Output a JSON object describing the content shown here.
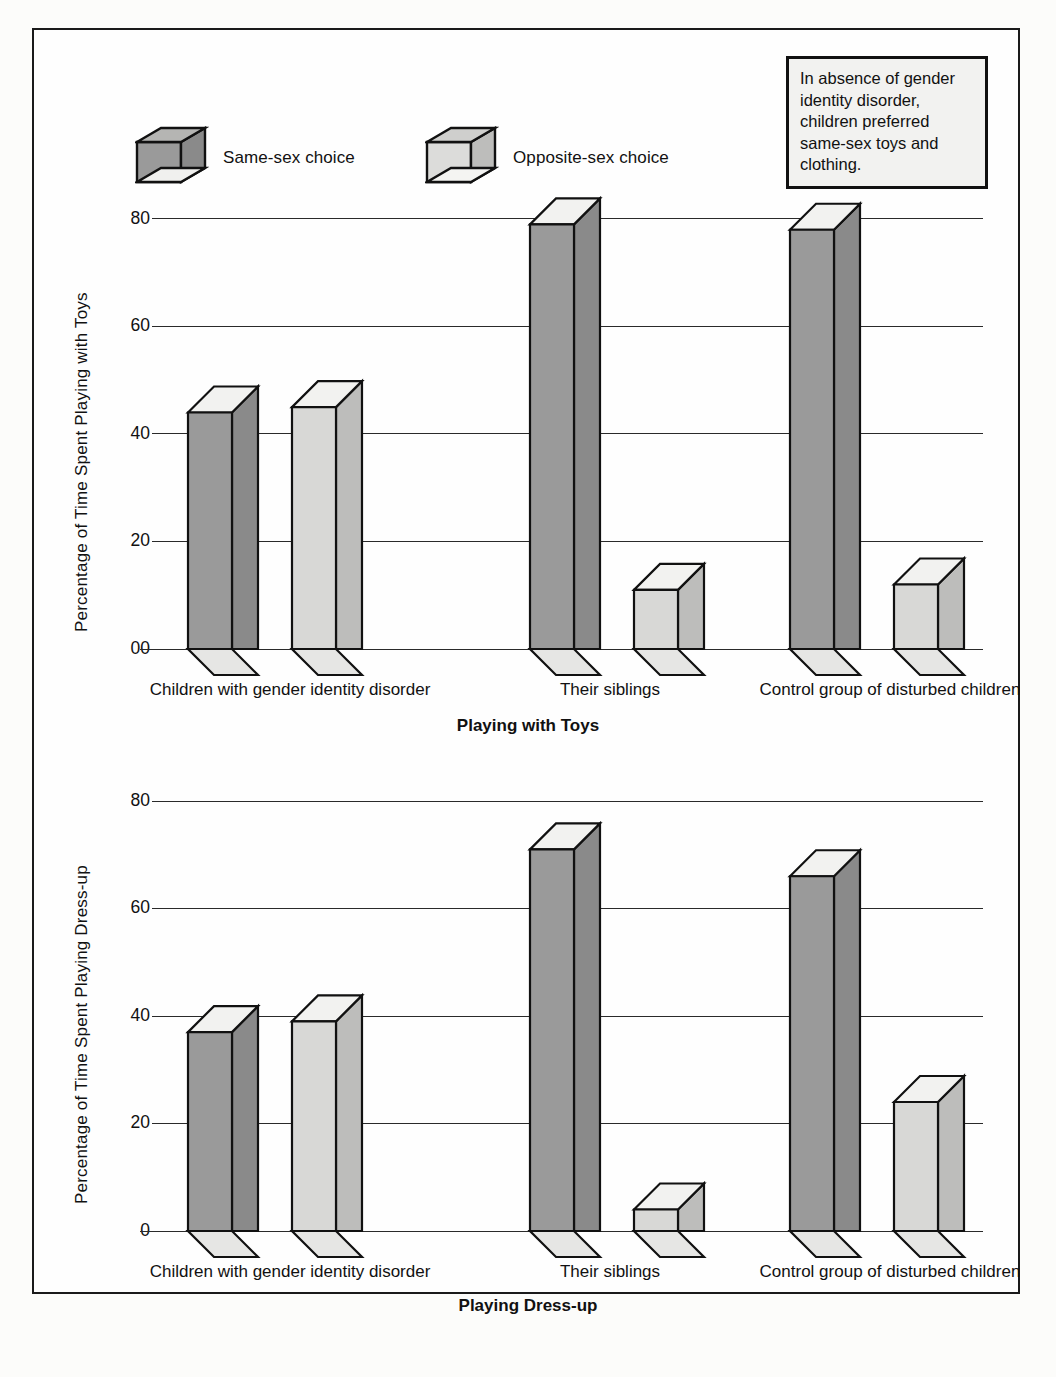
{
  "legend": {
    "items": [
      {
        "key": "same",
        "label": "Same-sex choice",
        "front_color": "#9a9a9a",
        "side_color": "#8a8a8a",
        "top_color": "#f0f0ee"
      },
      {
        "key": "opposite",
        "label": "Opposite-sex choice",
        "front_color": "#d8d8d6",
        "side_color": "#b5b5b3",
        "top_color": "#f4f4f2"
      }
    ]
  },
  "callout": {
    "text": "In absence of gender identity disorder, children preferred same-sex toys and clothing."
  },
  "chart_data": [
    {
      "id": "toys",
      "type": "bar",
      "title": "Playing with Toys",
      "ylabel": "Percentage of Time Spent Playing with Toys",
      "xlabel": "Playing with Toys",
      "categories": [
        "Children with gender identity disorder",
        "Their siblings",
        "Control group of disturbed children"
      ],
      "yticks": [
        "00",
        "20",
        "40",
        "60",
        "80"
      ],
      "ytick_values": [
        0,
        20,
        40,
        60,
        80
      ],
      "ylim": [
        0,
        80
      ],
      "grid": true,
      "legend_position": "above-plot",
      "series": [
        {
          "name": "Same-sex choice",
          "values": [
            44,
            79,
            78
          ]
        },
        {
          "name": "Opposite-sex choice",
          "values": [
            45,
            11,
            12
          ]
        }
      ]
    },
    {
      "id": "dressup",
      "type": "bar",
      "title": "Playing Dress-up",
      "ylabel": "Percentage of Time Spent Playing Dress-up",
      "xlabel": "Playing Dress-up",
      "categories": [
        "Children with gender identity disorder",
        "Their siblings",
        "Control group of disturbed children"
      ],
      "yticks": [
        "0",
        "20",
        "40",
        "60",
        "80"
      ],
      "ytick_values": [
        0,
        20,
        40,
        60,
        80
      ],
      "ylim": [
        0,
        80
      ],
      "grid": true,
      "legend_position": "none",
      "series": [
        {
          "name": "Same-sex choice",
          "values": [
            37,
            71,
            66
          ]
        },
        {
          "name": "Opposite-sex choice",
          "values": [
            39,
            4,
            24
          ]
        }
      ]
    }
  ],
  "colors": {
    "same_front": "#9a9a9a",
    "same_side": "#8a8a8a",
    "opposite_front": "#d8d8d6",
    "opposite_side": "#bdbdbb",
    "bar_top": "#f2f2f0",
    "floor": "#e6e6e4",
    "outline": "#111111",
    "grid": "#2a2a2a",
    "frame": "#1a1a1a",
    "page_bg": "#fcfcfa"
  }
}
